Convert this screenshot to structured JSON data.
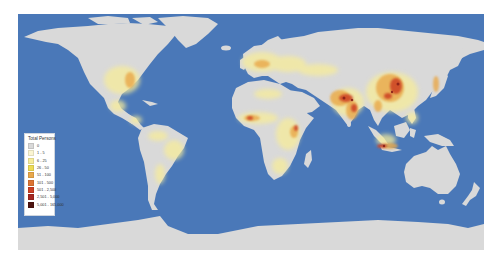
{
  "map": {
    "type": "choropleth-world-population",
    "ocean_color": "#4a78b8",
    "land_color": "#d9d9d9"
  },
  "legend": {
    "title": "Total Persons",
    "items": [
      {
        "label": "0",
        "color": "#d9d9d9"
      },
      {
        "label": "1 - 5",
        "color": "#fbf5d2"
      },
      {
        "label": "6 - 25",
        "color": "#f7ec9a"
      },
      {
        "label": "26 - 50",
        "color": "#eedc55"
      },
      {
        "label": "51 - 100",
        "color": "#e9a84a"
      },
      {
        "label": "101 - 500",
        "color": "#dd7432"
      },
      {
        "label": "501 - 2,500",
        "color": "#cc4024"
      },
      {
        "label": "2,501 - 5,000",
        "color": "#a52620"
      },
      {
        "label": "5,001 - 165,000",
        "color": "#4d1410"
      }
    ]
  }
}
